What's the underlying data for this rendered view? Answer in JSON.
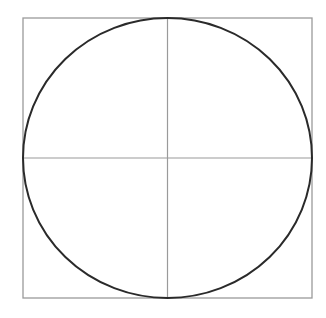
{
  "diagram": {
    "type": "circle-inscribed-in-square-with-axes",
    "colors": {
      "background": "#ffffff",
      "square_stroke": "#9a9a9a",
      "axis_stroke": "#9a9a9a",
      "circle_stroke": "#2a2a2a"
    },
    "square": {
      "x": 23,
      "y": 18,
      "width": 289,
      "height": 280
    },
    "circle": {
      "cx": 167.5,
      "cy": 158,
      "rx": 144.5,
      "ry": 140
    },
    "axes": {
      "vertical": {
        "x": 167.5,
        "y1": 18,
        "y2": 298
      },
      "horizontal": {
        "y": 158,
        "x1": 23,
        "x2": 312
      }
    }
  }
}
